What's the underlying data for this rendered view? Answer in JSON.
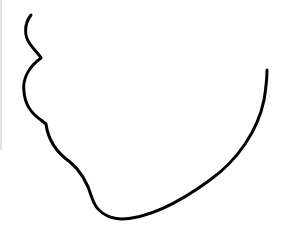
{
  "image": {
    "width": 283,
    "height": 230,
    "background": "#ffffff",
    "subject": "line drawing of a face profile outline (chin / jaw contour)",
    "stroke_color": "#000000",
    "stroke_width": 3,
    "edge_line_color": "#e2e2e2"
  }
}
